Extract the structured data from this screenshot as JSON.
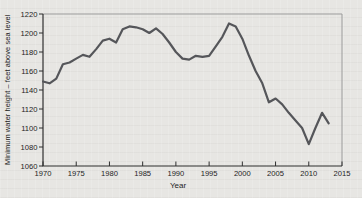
{
  "colors": {
    "background": "#e7e6e3",
    "line": "#55565a",
    "axis": "#2f2f2f",
    "frame": "#9b9b9b",
    "text": "#1d1d1d"
  },
  "chart_data": {
    "type": "line",
    "title": "",
    "xlabel": "Year",
    "ylabel": "Minimum water height – feet above sea level",
    "xlim": [
      1970,
      2015
    ],
    "ylim": [
      1060,
      1220
    ],
    "xticks": [
      1970,
      1975,
      1980,
      1985,
      1990,
      1995,
      2000,
      2005,
      2010,
      2015
    ],
    "yticks": [
      1060,
      1080,
      1100,
      1120,
      1140,
      1160,
      1180,
      1200,
      1220
    ],
    "grid": false,
    "legend": "none",
    "series": [
      {
        "name": "minimum-water-height",
        "x": [
          1970,
          1971,
          1972,
          1973,
          1974,
          1975,
          1976,
          1977,
          1978,
          1979,
          1980,
          1981,
          1982,
          1983,
          1984,
          1985,
          1986,
          1987,
          1988,
          1989,
          1990,
          1991,
          1992,
          1993,
          1994,
          1995,
          1996,
          1997,
          1998,
          1999,
          2000,
          2001,
          2002,
          2003,
          2004,
          2005,
          2006,
          2007,
          2008,
          2009,
          2010,
          2011,
          2012,
          2013
        ],
        "values": [
          1149,
          1147,
          1152,
          1167,
          1169,
          1173,
          1177,
          1175,
          1183,
          1192,
          1194,
          1190,
          1204,
          1207,
          1206,
          1204,
          1200,
          1205,
          1199,
          1190,
          1180,
          1173,
          1172,
          1176,
          1175,
          1176,
          1186,
          1196,
          1210,
          1207,
          1194,
          1176,
          1160,
          1147,
          1127,
          1131,
          1125,
          1116,
          1108,
          1100,
          1083,
          1100,
          1116,
          1105
        ]
      }
    ]
  }
}
